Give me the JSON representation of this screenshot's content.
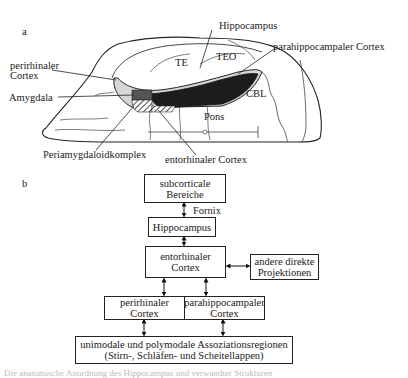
{
  "panel_a": {
    "label": "a",
    "region_labels": {
      "hippocampus": "Hippocampus",
      "perirhinal_line1": "perirhinaler",
      "perirhinal_line2": "Cortex",
      "te": "TE",
      "teo": "TEO",
      "parahippocampal": "parahippocampaler Cortex",
      "amygdala": "Amygdala",
      "cbl": "CBL",
      "pons": "Pons",
      "periamygdaloid": "Periamygdaloidkomplex",
      "entorhinal": "entorhinaler Cortex"
    }
  },
  "panel_b": {
    "label": "b",
    "boxes": {
      "subcortical": [
        "subcorticale",
        "Bereiche"
      ],
      "hippocampus": [
        "Hippocampus"
      ],
      "entorhinal": [
        "entorhinaler",
        "Cortex"
      ],
      "other_projections": [
        "andere direkte",
        "Projektionen"
      ],
      "perirhinal": [
        "perirhinaler",
        "Cortex"
      ],
      "parahippocampal": [
        "parahippocampaler",
        "Cortex"
      ],
      "association": [
        "unimodale und polymodale Assoziationsregionen",
        "(Stirn-, Schläfen- und Scheitellappen)"
      ]
    },
    "edge_labels": {
      "fornix": "Fornix"
    }
  },
  "caption": "Die anatomische Anordnung des Hippocampus und verwandter Strukturen"
}
